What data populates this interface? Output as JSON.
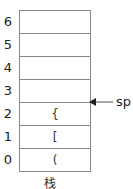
{
  "diagram": {
    "title": "栈",
    "pointer_label": "sp",
    "pointer_row_index": 3,
    "cells": [
      {
        "index": "6",
        "value": ""
      },
      {
        "index": "5",
        "value": ""
      },
      {
        "index": "4",
        "value": ""
      },
      {
        "index": "3",
        "value": ""
      },
      {
        "index": "2",
        "value": "{"
      },
      {
        "index": "1",
        "value": "["
      },
      {
        "index": "0",
        "value": "("
      }
    ]
  }
}
